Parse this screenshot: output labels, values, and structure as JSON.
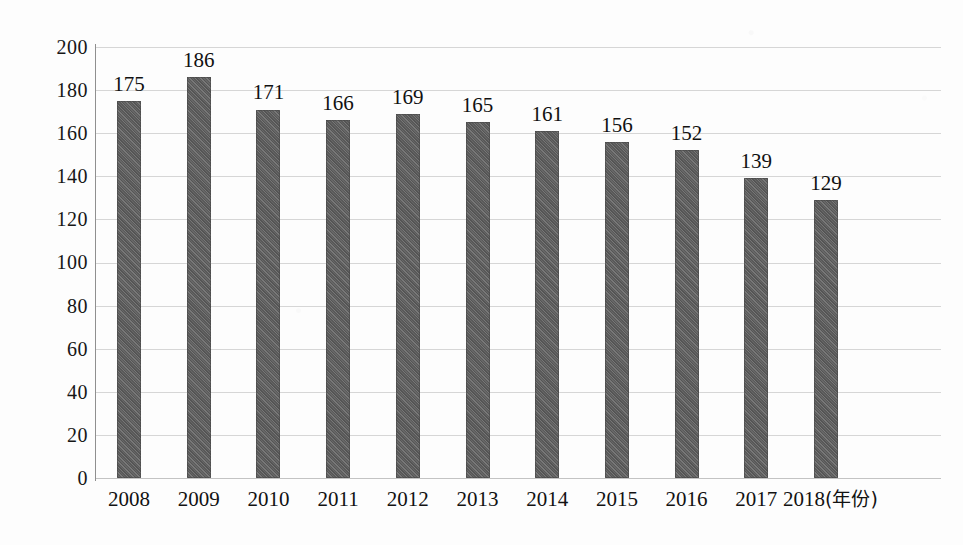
{
  "chart_data": {
    "type": "bar",
    "title": "",
    "xlabel": "年份",
    "xlabel_display": "(年份)",
    "ylabel": "",
    "categories": [
      "2008",
      "2009",
      "2010",
      "2011",
      "2012",
      "2013",
      "2014",
      "2015",
      "2016",
      "2017",
      "2018"
    ],
    "values": [
      175,
      186,
      171,
      166,
      169,
      165,
      161,
      156,
      152,
      139,
      129
    ],
    "value_labels": [
      "175",
      "186",
      "171",
      "166",
      "169",
      "165",
      "161",
      "156",
      "152",
      "139",
      "129"
    ],
    "ylim": [
      0,
      200
    ],
    "ytick_labels": [
      "0",
      "20",
      "40",
      "60",
      "80",
      "100",
      "120",
      "140",
      "160",
      "180",
      "200"
    ],
    "ytick_values": [
      0,
      20,
      40,
      60,
      80,
      100,
      120,
      140,
      160,
      180,
      200
    ],
    "grid": true,
    "grid_axis": "y",
    "legend": false,
    "legend_position": "none",
    "series": [
      {
        "name": "",
        "values": [
          175,
          186,
          171,
          166,
          169,
          165,
          161,
          156,
          152,
          139,
          129
        ]
      }
    ],
    "colors": {
      "bar_fill": "#5e5e5e",
      "gridline": "#cfcfcf",
      "axis": "#8f8f8f",
      "text": "#121212",
      "background": "#fdfdfd"
    }
  }
}
